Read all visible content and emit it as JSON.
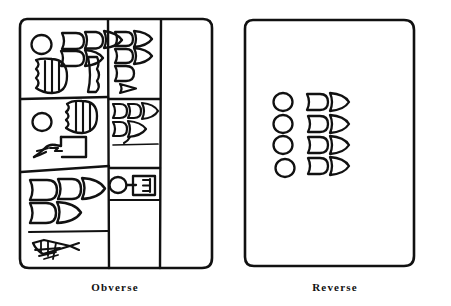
{
  "figure": {
    "kind": "line-drawing",
    "ink_color": "#111111",
    "background_color": "#ffffff",
    "panels": [
      {
        "id": "obverse",
        "caption": "Obverse",
        "description": "Rounded-corner tablet ruled into cells; left column subdivided into three registers, middle column into three registers, blank right column.",
        "cells": [
          {
            "id": "obv-r1-c1",
            "signs": [
              "circle",
              "wedge",
              "wedge",
              "wedge",
              "wedge",
              "hatched-semicircle",
              "tall-bent-wedge"
            ]
          },
          {
            "id": "obv-r1-c2",
            "signs": [
              "wedge",
              "wedge",
              "wedge",
              "wedge",
              "wedge",
              "small-triangle"
            ]
          },
          {
            "id": "obv-r2-c1",
            "signs": [
              "circle",
              "hatched-semicircle",
              "hand-and-box"
            ]
          },
          {
            "id": "obv-r2-c2",
            "signs": [
              "wedge",
              "wedge",
              "wedge",
              "wedge",
              "wedge"
            ]
          },
          {
            "id": "obv-r3-c1",
            "signs": [
              "wedge",
              "wedge",
              "wedge",
              "wedge",
              "wedge",
              "net-fish"
            ]
          },
          {
            "id": "obv-r3-c2",
            "signs": [
              "circle-on-stem",
              "boxed-E"
            ]
          },
          {
            "id": "obv-col3",
            "signs": []
          }
        ]
      },
      {
        "id": "reverse",
        "caption": "Reverse",
        "description": "Rounded-corner tablet, unruled, with a single group of four circles and seven wedges.",
        "cells": [
          {
            "id": "rev-group",
            "signs": [
              "circle",
              "circle",
              "circle",
              "circle",
              "wedge",
              "wedge",
              "wedge",
              "wedge",
              "wedge",
              "wedge",
              "wedge"
            ]
          }
        ]
      }
    ]
  }
}
